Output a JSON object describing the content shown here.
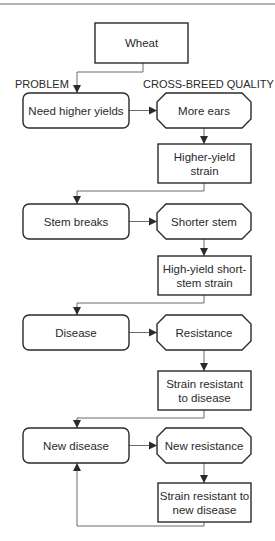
{
  "diagram": {
    "type": "flowchart",
    "column_labels": {
      "problem": "PROBLEM",
      "quality": "CROSS-BREED QUALITY"
    },
    "start": {
      "id": "wheat",
      "lines": [
        "Wheat"
      ]
    },
    "rows": [
      {
        "problem": {
          "id": "need-higher-yields",
          "lines": [
            "Need higher yields"
          ]
        },
        "quality": {
          "id": "more-ears",
          "lines": [
            "More ears"
          ]
        },
        "result": {
          "id": "higher-yield-strain",
          "lines": [
            "Higher-yield",
            "strain"
          ]
        }
      },
      {
        "problem": {
          "id": "stem-breaks",
          "lines": [
            "Stem breaks"
          ]
        },
        "quality": {
          "id": "shorter-stem",
          "lines": [
            "Shorter stem"
          ]
        },
        "result": {
          "id": "high-yield-short-stem-strain",
          "lines": [
            "High-yield short-",
            "stem strain"
          ]
        }
      },
      {
        "problem": {
          "id": "disease",
          "lines": [
            "Disease"
          ]
        },
        "quality": {
          "id": "resistance",
          "lines": [
            "Resistance"
          ]
        },
        "result": {
          "id": "strain-resistant-to-disease",
          "lines": [
            "Strain resistant",
            "to disease"
          ]
        }
      },
      {
        "problem": {
          "id": "new-disease",
          "lines": [
            "New disease"
          ]
        },
        "quality": {
          "id": "new-resistance",
          "lines": [
            "New resistance"
          ]
        },
        "result": {
          "id": "strain-resistant-to-new-disease",
          "lines": [
            "Strain resistant to",
            "new disease"
          ]
        }
      }
    ],
    "loop": {
      "from": "strain-resistant-to-new-disease",
      "to": "new-disease"
    }
  }
}
